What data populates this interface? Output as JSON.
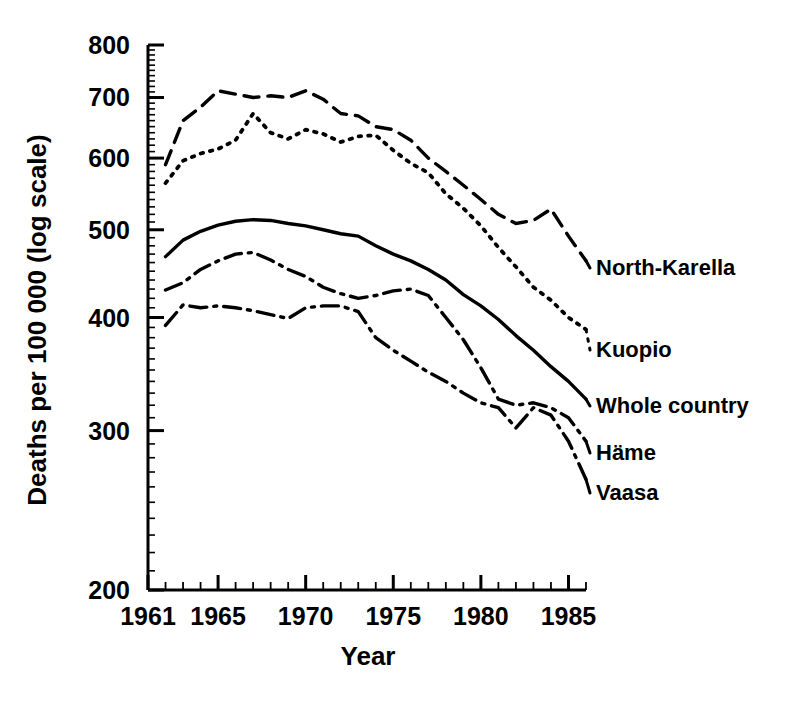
{
  "chart_data": {
    "type": "line",
    "title": "",
    "xlabel": "Year",
    "ylabel": "Deaths per 100 000 (log scale)",
    "yscale": "log",
    "ylim": [
      200,
      800
    ],
    "xlim": [
      1961,
      1986
    ],
    "grid": false,
    "legend_position": "right-inline-labels",
    "ytick_labels": [
      "800",
      "700",
      "600",
      "500",
      "400",
      "300",
      "200"
    ],
    "ytick_values": [
      800,
      700,
      600,
      500,
      400,
      300,
      200
    ],
    "xtick_labels": [
      "1961",
      "1965",
      "1970",
      "1975",
      "1980",
      "1985"
    ],
    "xtick_values": [
      1961,
      1965,
      1970,
      1975,
      1980,
      1985
    ],
    "minor_xticks": "every year",
    "x": [
      1962,
      1963,
      1964,
      1965,
      1966,
      1967,
      1968,
      1969,
      1970,
      1971,
      1972,
      1973,
      1974,
      1975,
      1976,
      1977,
      1978,
      1979,
      1980,
      1981,
      1982,
      1983,
      1984,
      1985,
      1986
    ],
    "series": [
      {
        "name": "North-Karelia",
        "label": "North-Karella",
        "linestyle": "dashed",
        "color": "#000000",
        "values": [
          590,
          660,
          683,
          712,
          706,
          700,
          703,
          700,
          712,
          697,
          672,
          668,
          650,
          645,
          628,
          600,
          580,
          560,
          540,
          520,
          508,
          512,
          527,
          492,
          462
        ]
      },
      {
        "name": "Kuopio",
        "label": "Kuopio",
        "linestyle": "dotted",
        "color": "#000000",
        "values": [
          563,
          596,
          607,
          614,
          628,
          672,
          640,
          630,
          645,
          638,
          625,
          634,
          636,
          612,
          592,
          578,
          548,
          528,
          505,
          478,
          455,
          432,
          418,
          400,
          388
        ]
      },
      {
        "name": "Whole country",
        "label": "Whole country",
        "linestyle": "solid",
        "color": "#000000",
        "values": [
          467,
          487,
          498,
          506,
          511,
          513,
          512,
          508,
          505,
          500,
          495,
          492,
          480,
          470,
          462,
          452,
          440,
          424,
          412,
          398,
          382,
          368,
          353,
          340,
          325
        ]
      },
      {
        "name": "Häme",
        "label": "Häme",
        "linestyle": "dash-dot",
        "color": "#000000",
        "values": [
          429,
          437,
          452,
          462,
          470,
          472,
          463,
          452,
          444,
          432,
          425,
          420,
          423,
          428,
          430,
          423,
          400,
          378,
          352,
          325,
          320,
          322,
          318,
          310,
          292
        ]
      },
      {
        "name": "Vaasa",
        "label": "Vaasa",
        "linestyle": "dash-dot",
        "color": "#000000",
        "values": [
          392,
          413,
          410,
          412,
          410,
          407,
          403,
          399,
          410,
          412,
          412,
          406,
          380,
          368,
          358,
          348,
          340,
          330,
          322,
          318,
          302,
          318,
          312,
          292,
          265
        ]
      }
    ]
  },
  "axis": {
    "y_title": "Deaths per 100 000 (log scale)",
    "x_title": "Year"
  },
  "labels": {
    "north_karelia": "North-Karella",
    "kuopio": "Kuopio",
    "whole_country": "Whole country",
    "hame": "Häme",
    "vaasa": "Vaasa"
  },
  "ticks": {
    "y": [
      "800",
      "700",
      "600",
      "500",
      "400",
      "300",
      "200"
    ],
    "x": [
      "1961",
      "1965",
      "1970",
      "1975",
      "1980",
      "1985"
    ]
  }
}
